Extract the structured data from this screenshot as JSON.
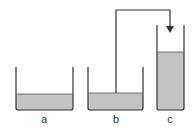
{
  "diagram": {
    "containers": [
      {
        "id": "a",
        "label": "a"
      },
      {
        "id": "b",
        "label": "b"
      },
      {
        "id": "c",
        "label": "c"
      }
    ],
    "colors": {
      "liquid": "#c4c4c4",
      "outline": "#333333",
      "background": "#ffffff"
    }
  }
}
